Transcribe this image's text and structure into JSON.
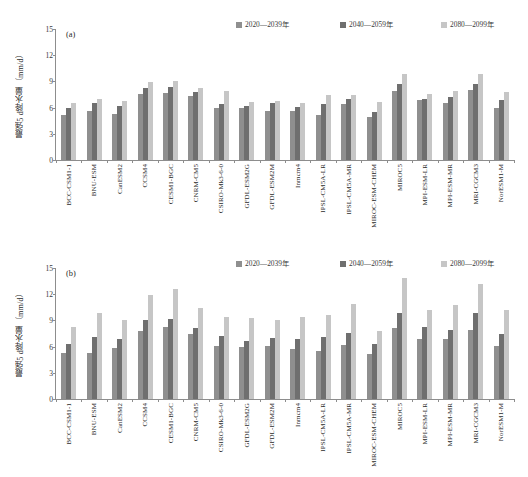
{
  "legend": {
    "items": [
      {
        "label": "2020—2039年",
        "color": "#8f8f8f"
      },
      {
        "label": "2040—2059年",
        "color": "#6f6f6f"
      },
      {
        "label": "2080—2099年",
        "color": "#c6c6c6"
      }
    ]
  },
  "axis": {
    "ylabel": "最强5 d降水量（mm/d）",
    "yticks": [
      "0",
      "3",
      "6",
      "9",
      "12",
      "15"
    ]
  },
  "panels": [
    {
      "tag": "(a)"
    },
    {
      "tag": "(b)"
    }
  ],
  "chart_data": [
    {
      "type": "bar",
      "title": "(a)",
      "xlabel": "",
      "ylabel": "最强5 d降水量（mm/d）",
      "ylim": [
        0,
        15
      ],
      "yticks": [
        0,
        3,
        6,
        9,
        12,
        15
      ],
      "grid": false,
      "legend_position": "top-right",
      "categories": [
        "BCC-CSM1-1",
        "BNU-ESM",
        "CanESM2",
        "CCSM4",
        "CESM1-BGC",
        "CNRM-CM5",
        "CSIRO-Mk3-6-0",
        "GFDL-ESM2G",
        "GFDL-ESM2M",
        "Inmcm4",
        "IPSL-CM5A-LR",
        "IPSL-CM5A-MR",
        "MIROC-ESM-CHEM",
        "MIROC5",
        "MPI-ESM-LR",
        "MPI-ESM-MR",
        "MRI-CGCM3",
        "NorESM1-M"
      ],
      "series": [
        {
          "name": "2020—2039年",
          "color": "#8f8f8f",
          "values": [
            5.2,
            5.6,
            5.3,
            7.6,
            7.7,
            7.3,
            6.0,
            5.9,
            5.6,
            5.6,
            5.2,
            6.4,
            4.9,
            7.9,
            6.9,
            6.5,
            8.0,
            5.9
          ]
        },
        {
          "name": "2040—2059年",
          "color": "#6f6f6f",
          "values": [
            5.9,
            6.5,
            6.2,
            8.3,
            8.4,
            7.8,
            6.4,
            6.2,
            6.5,
            6.1,
            6.4,
            7.0,
            5.5,
            8.7,
            7.0,
            7.2,
            8.7,
            6.9
          ]
        },
        {
          "name": "2080—2099年",
          "color": "#c6c6c6",
          "values": [
            6.5,
            7.0,
            6.8,
            8.9,
            9.1,
            8.2,
            7.9,
            6.7,
            6.8,
            6.5,
            7.4,
            7.4,
            6.6,
            9.8,
            7.6,
            7.9,
            9.8,
            7.8
          ]
        }
      ]
    },
    {
      "type": "bar",
      "title": "(b)",
      "xlabel": "",
      "ylabel": "最强5 d降水量（mm/d）",
      "ylim": [
        0,
        15
      ],
      "yticks": [
        0,
        3,
        6,
        9,
        12,
        15
      ],
      "grid": false,
      "legend_position": "top-right",
      "categories": [
        "BCC-CSM1-1",
        "BNU-ESM",
        "CanESM2",
        "CCSM4",
        "CESM1-BGC",
        "CNRM-CM5",
        "CSIRO-Mk3-6-0",
        "GFDL-ESM2G",
        "GFDL-ESM2M",
        "Inmcm4",
        "IPSL-CM5A-LR",
        "IPSL-CM5A-MR",
        "MIROC-ESM-CHEM",
        "MIROC5",
        "MPI-ESM-LR",
        "MPI-ESM-MR",
        "MRI-CGCM3",
        "NorESM1-M"
      ],
      "series": [
        {
          "name": "2020—2039年",
          "color": "#8f8f8f",
          "values": [
            5.3,
            5.3,
            5.8,
            7.8,
            8.3,
            7.4,
            6.1,
            6.0,
            6.1,
            5.7,
            5.5,
            6.2,
            5.1,
            8.1,
            6.9,
            6.9,
            7.9,
            6.1
          ]
        },
        {
          "name": "2040—2059年",
          "color": "#6f6f6f",
          "values": [
            6.3,
            7.1,
            6.9,
            9.1,
            9.2,
            8.1,
            7.2,
            6.7,
            7.0,
            6.9,
            7.1,
            7.6,
            6.3,
            9.8,
            8.2,
            7.9,
            9.8,
            7.4
          ]
        },
        {
          "name": "2080—2099年",
          "color": "#c6c6c6",
          "values": [
            8.2,
            9.9,
            9.1,
            11.9,
            12.6,
            10.4,
            9.4,
            9.3,
            9.0,
            9.4,
            9.6,
            10.9,
            7.8,
            13.8,
            10.2,
            10.8,
            13.2,
            10.2
          ]
        }
      ]
    }
  ]
}
